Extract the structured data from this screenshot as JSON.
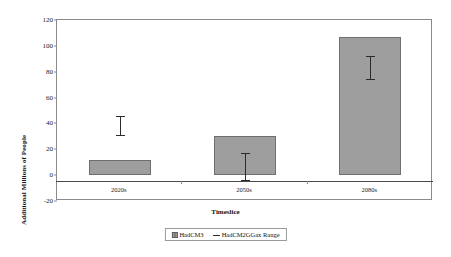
{
  "chart_data": {
    "type": "bar",
    "title": "",
    "xlabel": "Timeslice",
    "ylabel": "Additional Millions of People",
    "categories": [
      "2020s",
      "2050s",
      "2080s"
    ],
    "series": [
      {
        "name": "HadCM3",
        "values": [
          11.5,
          30.5,
          106.5
        ]
      }
    ],
    "error_ranges": {
      "name": "HadCM2GGax Range",
      "low": [
        31,
        -4,
        74
      ],
      "high": [
        46,
        17,
        92
      ]
    },
    "ylim": [
      -20,
      120
    ],
    "yticks": [
      "120",
      "100",
      "80",
      "60",
      "40",
      "20",
      "0",
      "-20"
    ],
    "ytick_values": [
      120,
      100,
      80,
      60,
      40,
      20,
      0,
      -20
    ],
    "grid": false,
    "legend_position": "bottom",
    "legend": [
      "HadCM3",
      "HadCM2GGax Range"
    ],
    "colors": {
      "bar_fill": "#9e9e9e",
      "bar_border": "#6f6f6f",
      "error_bar": "#2b2b2b",
      "axis": "#8a8a8a",
      "background": "#ffffff"
    }
  }
}
